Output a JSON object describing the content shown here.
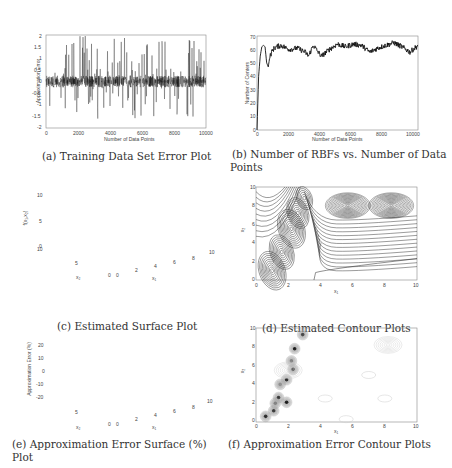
{
  "chart_data": [
    {
      "id": "a",
      "type": "line",
      "caption": "(a) Training Data Set Error Plot",
      "title": "",
      "xlabel": "Number of Data Points",
      "ylabel": "Approximation Error",
      "xlim": [
        0,
        10000
      ],
      "ylim": [
        -2,
        2
      ],
      "xticks": [
        "0",
        "2000",
        "4000",
        "6000",
        "8000",
        "10000"
      ],
      "yticks": [
        "2",
        "1.5",
        "1",
        "0.5",
        "0",
        "-0.5",
        "-1",
        "-1.5",
        "-2"
      ],
      "series": [
        {
          "name": "error",
          "description": "dense noise around 0, spikes up to about ±1.8"
        }
      ]
    },
    {
      "id": "b",
      "type": "line",
      "caption": "(b) Number of RBFs vs. Number of Data Points",
      "xlabel": "Number of Data Points",
      "ylabel": "Number of Centers",
      "xlim": [
        0,
        10000
      ],
      "ylim": [
        0,
        70
      ],
      "xticks": [
        "0",
        "2000",
        "4000",
        "6000",
        "8000",
        "10000"
      ],
      "yticks": [
        "70",
        "60",
        "50",
        "40",
        "30",
        "20",
        "10",
        "0"
      ],
      "x": [
        0,
        100,
        200,
        300,
        400,
        500,
        600,
        700,
        800,
        1000,
        1200,
        1500,
        2000,
        2500,
        3000,
        3200,
        3500,
        3800,
        4000,
        4500,
        5000,
        5500,
        6000,
        6500,
        7000,
        7500,
        8000,
        8500,
        9000,
        9500,
        10000
      ],
      "values": [
        0,
        40,
        55,
        62,
        63,
        62,
        50,
        47,
        55,
        60,
        62,
        63,
        60,
        61,
        58,
        55,
        63,
        58,
        55,
        60,
        64,
        62,
        64,
        63,
        58,
        61,
        63,
        65,
        62,
        58,
        63
      ]
    },
    {
      "id": "c",
      "type": "surface",
      "caption": "(c) Estimated Surface Plot",
      "xlabel": "x1",
      "ylabel": "x2",
      "zlabel": "f(x1,x2)",
      "xticks": [
        "0",
        "2",
        "4",
        "6",
        "8",
        "10"
      ],
      "yticks": [
        "0",
        "5",
        "10"
      ],
      "zticks": [
        "0",
        "5",
        "10"
      ]
    },
    {
      "id": "d",
      "type": "contour",
      "caption": "(d) Estimated Contour Plots",
      "xlabel": "x1",
      "ylabel": "x2",
      "xlim": [
        0,
        10
      ],
      "ylim": [
        0,
        10
      ],
      "xticks": [
        "0",
        "2",
        "4",
        "6",
        "8",
        "10"
      ],
      "yticks": [
        "10",
        "8",
        "6",
        "4",
        "2",
        "0"
      ]
    },
    {
      "id": "e",
      "type": "surface",
      "caption": "(e) Approximation Error Surface (%) Plot",
      "xlabel": "x1",
      "ylabel": "x2",
      "zlabel": "Approximation Error (%)",
      "xticks": [
        "0",
        "2",
        "4",
        "6",
        "8",
        "10"
      ],
      "yticks": [
        "0",
        "5",
        "10"
      ],
      "zticks": [
        "20",
        "10",
        "0",
        "-10",
        "-20"
      ]
    },
    {
      "id": "f",
      "type": "contour",
      "caption": "(f) Approximation Error Contour Plots",
      "xlabel": "x1",
      "ylabel": "x2",
      "xlim": [
        0,
        10
      ],
      "ylim": [
        0,
        10
      ],
      "xticks": [
        "0",
        "2",
        "4",
        "6",
        "8",
        "10"
      ],
      "yticks": [
        "10",
        "8",
        "6",
        "4",
        "2",
        "0"
      ]
    }
  ],
  "captions": {
    "a": "(a) Training Data Set Error Plot",
    "b1": "(b) Number of RBFs vs. Number of Data",
    "b2": "Points",
    "c": "(c) Estimated Surface Plot",
    "d": "(d) Estimated Contour Plots",
    "e": "(e) Approximation Error Surface (%) Plot",
    "f": "(f) Approximation Error Contour Plots"
  },
  "axes": {
    "a": {
      "xlabel": "Number of Data Points",
      "ylabel": "Approximation Error",
      "xticks": [
        "0",
        "2000",
        "4000",
        "6000",
        "8000",
        "10000"
      ],
      "yticks": [
        "2",
        "1.5",
        "1",
        "0.5",
        "0",
        "-0.5",
        "-1",
        "-1.5",
        "-2"
      ]
    },
    "b": {
      "xlabel": "Number of Data Points",
      "ylabel": "Number of Centers",
      "xticks": [
        "0",
        "2000",
        "4000",
        "6000",
        "8000",
        "10000"
      ],
      "yticks": [
        "70",
        "60",
        "50",
        "40",
        "30",
        "20",
        "10",
        "0"
      ]
    },
    "c": {
      "xlabel": "x₁",
      "ylabel": "x₂",
      "zlabel": "f(x₁,x₂)",
      "xticks": [
        "0",
        "2",
        "4",
        "6",
        "8",
        "10"
      ],
      "yticks": [
        "0",
        "5",
        "10"
      ],
      "zticks": [
        "10",
        "5",
        "0"
      ]
    },
    "d": {
      "xlabel": "x₁",
      "ylabel": "x₂",
      "xticks": [
        "0",
        "2",
        "4",
        "6",
        "8",
        "10"
      ],
      "yticks": [
        "10",
        "8",
        "6",
        "4",
        "2",
        "0"
      ]
    },
    "e": {
      "xlabel": "x₁",
      "ylabel": "x₂",
      "zlabel": "Approximation Error (%)",
      "xticks": [
        "0",
        "2",
        "4",
        "6",
        "8",
        "10"
      ],
      "yticks": [
        "0",
        "5",
        "10"
      ],
      "zticks": [
        "20",
        "10",
        "0",
        "-10",
        "-20"
      ]
    },
    "f": {
      "xlabel": "x₁",
      "ylabel": "x₂",
      "xticks": [
        "0",
        "2",
        "4",
        "6",
        "8",
        "10"
      ],
      "yticks": [
        "10",
        "8",
        "6",
        "4",
        "2",
        "0"
      ]
    }
  }
}
